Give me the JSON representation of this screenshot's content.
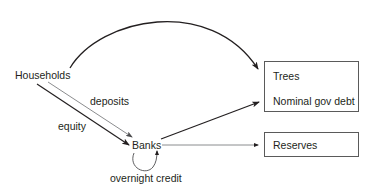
{
  "diagram": {
    "nodes": {
      "households": "Households",
      "banks": "Banks",
      "assets_box": {
        "items": [
          "Trees",
          "Nominal gov debt"
        ]
      },
      "reserves_box": {
        "items": [
          "Reserves"
        ]
      }
    },
    "edges": [
      {
        "from": "Households",
        "to": "Trees / Nominal gov debt",
        "label": ""
      },
      {
        "from": "Households",
        "to": "Banks",
        "label": "deposits"
      },
      {
        "from": "Households",
        "to": "Banks",
        "label": "equity"
      },
      {
        "from": "Banks",
        "to": "Trees / Nominal gov debt",
        "label": ""
      },
      {
        "from": "Banks",
        "to": "Reserves",
        "label": ""
      },
      {
        "from": "Banks",
        "to": "Banks",
        "label": "overnight credit"
      }
    ],
    "edge_labels": {
      "deposits": "deposits",
      "equity": "equity",
      "overnight_credit": "overnight credit"
    },
    "colors": {
      "text": "#231f20",
      "strong_arrow": "#231f20",
      "light_arrow": "#6d6e71",
      "box_border": "#5a5a5a"
    }
  }
}
